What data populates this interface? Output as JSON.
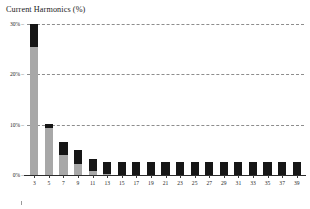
{
  "chart_data": {
    "type": "bar",
    "title": "Current Harmonics (%)",
    "xlabel": "",
    "ylabel": "",
    "ylim": [
      0,
      30
    ],
    "grid": true,
    "legend": "none",
    "categories": [
      "3",
      "5",
      "7",
      "9",
      "11",
      "13",
      "15",
      "17",
      "19",
      "21",
      "23",
      "25",
      "27",
      "29",
      "31",
      "33",
      "35",
      "37",
      "39"
    ],
    "yticks": [
      {
        "value": 0,
        "label": "0%"
      },
      {
        "value": 10,
        "label": "10%"
      },
      {
        "value": 20,
        "label": "20%"
      },
      {
        "value": 30,
        "label": "30%"
      }
    ],
    "series": [
      {
        "name": "measured",
        "color": "#a8a8a8",
        "values": [
          25.4,
          9.4,
          3.9,
          2.2,
          0.7,
          0.3,
          0.0,
          0.0,
          0.0,
          0.0,
          0.0,
          0.0,
          0.0,
          0.0,
          0.0,
          0.0,
          0.0,
          0.0,
          0.0
        ]
      },
      {
        "name": "limit",
        "color": "#161616",
        "values": [
          4.6,
          0.7,
          2.7,
          2.8,
          2.4,
          2.3,
          2.5,
          2.5,
          2.5,
          2.5,
          2.5,
          2.5,
          2.5,
          2.5,
          2.5,
          2.5,
          2.5,
          2.5,
          2.5
        ]
      }
    ],
    "totals": [
      30.0,
      10.1,
      6.6,
      5.0,
      3.1,
      2.6,
      2.5,
      2.5,
      2.5,
      2.5,
      2.5,
      2.5,
      2.5,
      2.5,
      2.5,
      2.5,
      2.5,
      2.5,
      2.5
    ]
  }
}
